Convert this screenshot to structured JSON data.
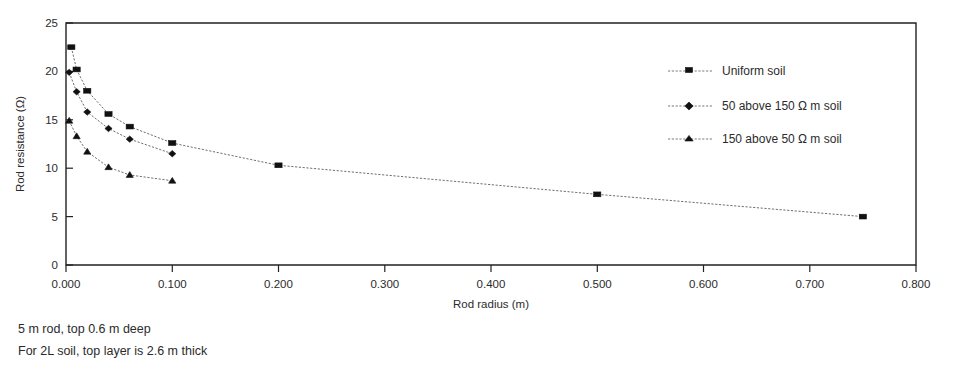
{
  "chart_data": {
    "type": "line",
    "title": "",
    "xlabel": "Rod radius (m)",
    "ylabel": "Rod resistance (Ω)",
    "xlim": [
      0.0,
      0.8
    ],
    "ylim": [
      0,
      25
    ],
    "xticks": [
      "0.000",
      "0.100",
      "0.200",
      "0.300",
      "0.400",
      "0.500",
      "0.600",
      "0.700",
      "0.800"
    ],
    "xtick_values": [
      0.0,
      0.1,
      0.2,
      0.3,
      0.4,
      0.5,
      0.6,
      0.7,
      0.8
    ],
    "yticks": [
      "0",
      "5",
      "10",
      "15",
      "20",
      "25"
    ],
    "ytick_values": [
      0,
      5,
      10,
      15,
      20,
      25
    ],
    "grid": false,
    "legend_position": "upper-right",
    "series": [
      {
        "name": "Uniform soil",
        "marker": "square",
        "x": [
          0.005,
          0.01,
          0.02,
          0.04,
          0.06,
          0.1,
          0.2,
          0.5,
          0.75
        ],
        "y": [
          22.5,
          20.2,
          18.0,
          15.6,
          14.3,
          12.6,
          10.3,
          7.3,
          5.0
        ]
      },
      {
        "name": "50 above 150 Ω m soil",
        "marker": "diamond",
        "x": [
          0.003,
          0.01,
          0.02,
          0.04,
          0.06,
          0.1
        ],
        "y": [
          19.9,
          17.9,
          15.8,
          14.1,
          13.0,
          11.5
        ]
      },
      {
        "name": "150 above 50 Ω m soil",
        "marker": "triangle",
        "x": [
          0.003,
          0.01,
          0.02,
          0.04,
          0.06,
          0.1
        ],
        "y": [
          14.9,
          13.3,
          11.7,
          10.1,
          9.3,
          8.7
        ]
      }
    ],
    "annotations": [
      "5 m rod, top 0.6 m deep",
      "For 2L soil, top layer is 2.6 m thick"
    ]
  },
  "figure": {
    "notes": {
      "line1": "5 m rod, top 0.6 m deep",
      "line2": "For 2L soil, top layer is 2.6 m thick"
    },
    "axis": {
      "x_title": "Rod radius (m)",
      "y_title": "Rod resistance (Ω)"
    },
    "legend": {
      "item0": "Uniform soil",
      "item1": "50 above 150 Ω m soil",
      "item2": "150 above 50 Ω m soil"
    },
    "xtick_labels": {
      "t0": "0.000",
      "t1": "0.100",
      "t2": "0.200",
      "t3": "0.300",
      "t4": "0.400",
      "t5": "0.500",
      "t6": "0.600",
      "t7": "0.700",
      "t8": "0.800"
    },
    "ytick_labels": {
      "t0": "0",
      "t1": "5",
      "t2": "10",
      "t3": "15",
      "t4": "20",
      "t5": "25"
    },
    "colors": {
      "ink": "#1a1a1a",
      "line": "#4a4a4a",
      "background": "#ffffff"
    }
  }
}
